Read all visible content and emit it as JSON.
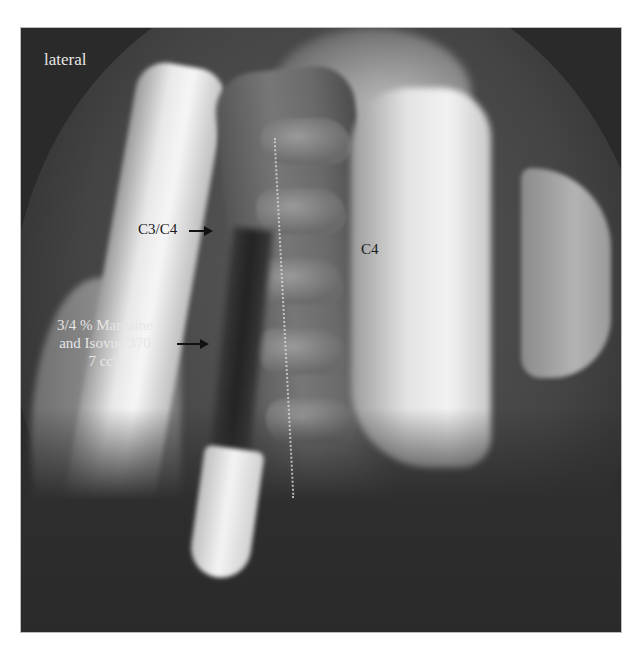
{
  "image": {
    "type": "lateral cervical spine fluoroscopy",
    "background": "#ffffff",
    "frame_color": "#2a2a2a"
  },
  "labels": {
    "view": "lateral",
    "level_pointer": "C3/C4",
    "vertebra": "C4",
    "injectate": {
      "line1": "3/4 % Marcaine",
      "line2": "and Isovue 370",
      "line3": "7 cc's"
    }
  },
  "annotations": {
    "arrow_c3c4": "right-arrow",
    "arrow_injectate": "right-arrow"
  }
}
